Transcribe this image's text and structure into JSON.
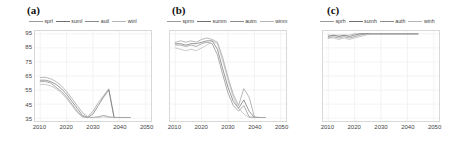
{
  "figure": {
    "background": "#ffffff",
    "grid_color": "#e6e6e6",
    "axis_color": "#d8d8d8",
    "tick_text_color": "#444444"
  },
  "panels": [
    {
      "tag": "(a)",
      "y_axis": {
        "label": "Availability (%)",
        "ticks": [
          "35",
          "45",
          "55",
          "65",
          "75",
          "85",
          "95"
        ],
        "show_ticks": true
      },
      "x_axis": {
        "ticks": [
          "2010",
          "2020",
          "2030",
          "2040",
          "2050"
        ]
      },
      "legend": [
        {
          "label": "sprl",
          "color": "#9a9a9a"
        },
        {
          "label": "suml",
          "color": "#6f6f6f"
        },
        {
          "label": "autl",
          "color": "#8a8a8a"
        },
        {
          "label": "winl",
          "color": "#b4b4b4"
        }
      ]
    },
    {
      "tag": "(b)",
      "y_axis": {
        "label": "",
        "ticks": [],
        "show_ticks": false
      },
      "x_axis": {
        "ticks": [
          "2010",
          "2020",
          "2030",
          "2040",
          "2050"
        ]
      },
      "legend": [
        {
          "label": "sprm",
          "color": "#9a9a9a"
        },
        {
          "label": "summ",
          "color": "#6f6f6f"
        },
        {
          "label": "autm",
          "color": "#8a8a8a"
        },
        {
          "label": "winm",
          "color": "#b4b4b4"
        }
      ]
    },
    {
      "tag": "(c)",
      "y_axis": {
        "label": "",
        "ticks": [],
        "show_ticks": false
      },
      "x_axis": {
        "ticks": [
          "2010",
          "2020",
          "2030",
          "2040",
          "2050"
        ]
      },
      "legend": [
        {
          "label": "sprh",
          "color": "#9a9a9a"
        },
        {
          "label": "sumh",
          "color": "#6f6f6f"
        },
        {
          "label": "auth",
          "color": "#8a8a8a"
        },
        {
          "label": "winh",
          "color": "#b4b4b4"
        }
      ]
    }
  ],
  "chart_data": [
    {
      "type": "line",
      "title": "(a)",
      "xlabel": "",
      "ylabel": "Availability (%)",
      "xlim": [
        2008,
        2052
      ],
      "ylim": [
        33,
        97
      ],
      "yticks": [
        35,
        45,
        55,
        65,
        75,
        85,
        95
      ],
      "xticks": [
        2010,
        2020,
        2030,
        2040,
        2050
      ],
      "grid": true,
      "legend_position": "above-left",
      "x": [
        2010,
        2012,
        2014,
        2016,
        2018,
        2020,
        2022,
        2024,
        2026,
        2028,
        2030,
        2032,
        2034,
        2036,
        2038,
        2040,
        2042,
        2044
      ],
      "series": [
        {
          "name": "sprl",
          "color": "#9a9a9a",
          "values": [
            64,
            64,
            63,
            61,
            58,
            54,
            49,
            44,
            39,
            36,
            40,
            46,
            51,
            56,
            35.5,
            35.5,
            35.5,
            35.5
          ]
        },
        {
          "name": "suml",
          "color": "#6f6f6f",
          "values": [
            62,
            62,
            61,
            59,
            56,
            52,
            47,
            42,
            37,
            35.5,
            38,
            44,
            50,
            55,
            35.5,
            35.5,
            35.5,
            35.5
          ]
        },
        {
          "name": "autl",
          "color": "#8a8a8a",
          "values": [
            61,
            61,
            60,
            57,
            54,
            50,
            45,
            40,
            36,
            35.5,
            35.5,
            36,
            37,
            36,
            35.5,
            35.5,
            35.5,
            35.5
          ]
        },
        {
          "name": "winl",
          "color": "#b4b4b4",
          "values": [
            59,
            59,
            58,
            56,
            53,
            49,
            44,
            39,
            36,
            35.5,
            35.5,
            35.5,
            36,
            35.5,
            35.5,
            35.5,
            35.5,
            35.5
          ]
        }
      ]
    },
    {
      "type": "line",
      "title": "(b)",
      "xlabel": "",
      "ylabel": "",
      "xlim": [
        2008,
        2052
      ],
      "ylim": [
        33,
        97
      ],
      "yticks": [
        35,
        45,
        55,
        65,
        75,
        85,
        95
      ],
      "xticks": [
        2010,
        2020,
        2030,
        2040,
        2050
      ],
      "grid": true,
      "legend_position": "above-left",
      "x": [
        2010,
        2012,
        2014,
        2016,
        2018,
        2020,
        2022,
        2024,
        2026,
        2028,
        2030,
        2032,
        2034,
        2036,
        2038,
        2040,
        2042,
        2044
      ],
      "series": [
        {
          "name": "sprm",
          "color": "#9a9a9a",
          "values": [
            89,
            90,
            89,
            90,
            89,
            91,
            92,
            91,
            89,
            78,
            64,
            52,
            44,
            56,
            50,
            36,
            35.5,
            35.5
          ]
        },
        {
          "name": "summ",
          "color": "#6f6f6f",
          "values": [
            88,
            88,
            87,
            88,
            88,
            89,
            90,
            90,
            84,
            70,
            57,
            47,
            42,
            48,
            40,
            35.5,
            35.5,
            35.5
          ]
        },
        {
          "name": "autm",
          "color": "#8a8a8a",
          "values": [
            87,
            87,
            86,
            87,
            86,
            88,
            89,
            88,
            80,
            66,
            53,
            44,
            40,
            44,
            36,
            35.5,
            35.5,
            35.5
          ]
        },
        {
          "name": "winm",
          "color": "#b4b4b4",
          "values": [
            85,
            84,
            83,
            84,
            83,
            85,
            87,
            90,
            88,
            76,
            62,
            50,
            42,
            38,
            35.5,
            35.5,
            35.5,
            35.5
          ]
        }
      ]
    },
    {
      "type": "line",
      "title": "(c)",
      "xlabel": "",
      "ylabel": "",
      "xlim": [
        2008,
        2052
      ],
      "ylim": [
        33,
        97
      ],
      "yticks": [
        35,
        45,
        55,
        65,
        75,
        85,
        95
      ],
      "xticks": [
        2010,
        2020,
        2030,
        2040,
        2050
      ],
      "grid": true,
      "legend_position": "above-left",
      "x": [
        2010,
        2012,
        2014,
        2016,
        2018,
        2020,
        2022,
        2024,
        2026,
        2028,
        2030,
        2032,
        2034,
        2036,
        2038,
        2040,
        2042,
        2044
      ],
      "series": [
        {
          "name": "sprh",
          "color": "#9a9a9a",
          "values": [
            94,
            94,
            94,
            94,
            94,
            95,
            95,
            95,
            95,
            95,
            95,
            95,
            95,
            95,
            95,
            95,
            95,
            95
          ]
        },
        {
          "name": "sumh",
          "color": "#6f6f6f",
          "values": [
            93,
            94,
            93,
            94,
            93,
            94,
            95,
            95,
            95,
            95,
            95,
            95,
            95,
            95,
            95,
            95,
            95,
            95
          ]
        },
        {
          "name": "auth",
          "color": "#8a8a8a",
          "values": [
            92,
            93,
            92,
            93,
            92,
            93,
            94,
            95,
            95,
            95,
            95,
            95,
            95,
            95,
            95,
            95,
            95,
            95
          ]
        },
        {
          "name": "winh",
          "color": "#b4b4b4",
          "values": [
            92,
            92,
            91,
            92,
            91,
            92,
            93,
            94,
            95,
            95,
            95,
            95,
            95,
            95,
            95,
            95,
            95,
            95
          ]
        }
      ]
    }
  ]
}
